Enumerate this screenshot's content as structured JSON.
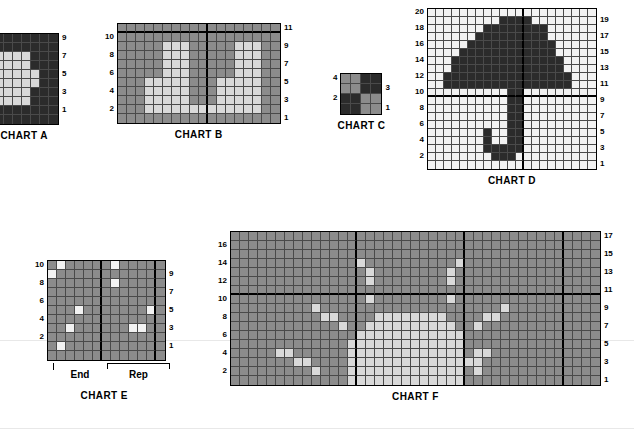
{
  "page": {
    "background": "#ffffff"
  },
  "palette": {
    "dark": "#2b2b2b",
    "mid": "#8c8c8c",
    "light": "#d9d9d9",
    "white": "#f2f2f2",
    "grid_line": "#4a4a4a",
    "heavy_line": "#000000"
  },
  "charts": [
    {
      "id": "chart-a",
      "caption": "CHART A",
      "cols": 8,
      "rows": 10,
      "cell": 9,
      "clipped_left": true,
      "axis_left": [],
      "axis_right": [
        "9",
        "",
        "7",
        "",
        "5",
        "",
        "3",
        "",
        "1",
        ""
      ],
      "cells": [
        "DDDDDDDD",
        "DDDDDDDD",
        "LLLLLDDD",
        "LLLLLDDD",
        "LLLLLLDD",
        "LLLLLLDD",
        "LLLLLDDD",
        "LLLLLDDD",
        "DDDDDDDD",
        "DDDDDDDD"
      ]
    },
    {
      "id": "chart-b",
      "caption": "CHART B",
      "cols": 18,
      "rows": 11,
      "cell": 9,
      "heavy_col_after": 10,
      "heavy_row_after": 0,
      "axis_left": [
        "",
        "10",
        "",
        "8",
        "",
        "6",
        "",
        "4",
        "",
        "2",
        ""
      ],
      "axis_right": [
        "11",
        "",
        "9",
        "",
        "7",
        "",
        "5",
        "",
        "3",
        "",
        "1"
      ],
      "cells": [
        "MMMMMMMMMMMMMMMMMM",
        "MMMMMMMMMMMMMMMMMM",
        "MMMMMLLLMMMMMLLLMM",
        "MMMMMLLLMMMMMLLLMM",
        "MMMMMLLLMMMMMLLLMM",
        "MMMMMLLLMMMMMLLLMM",
        "MMMLLLLLMMMLLLLLMM",
        "MMMLLLLLMMMLLLLLMM",
        "MMMLLLLLMMMLLLLLMM",
        "MMMLLLLLLLLLLLLLMM",
        "MMMMMMMMMMMMMMMMMM"
      ]
    },
    {
      "id": "chart-c",
      "caption": "CHART C",
      "cols": 4,
      "rows": 4,
      "cell": 10,
      "axis_left": [
        "4",
        "",
        "2",
        ""
      ],
      "axis_right": [
        "",
        "3",
        "",
        "1"
      ],
      "cells": [
        "MMDD",
        "MMDD",
        "DDMM",
        "DDMM"
      ]
    },
    {
      "id": "chart-d",
      "caption": "CHART D",
      "cols": 21,
      "rows": 20,
      "cell": 8,
      "heavy_col_after": 12,
      "heavy_row_after": 10,
      "axis_left": [
        "20",
        "",
        "18",
        "",
        "16",
        "",
        "14",
        "",
        "12",
        "",
        "10",
        "",
        "8",
        "",
        "6",
        "",
        "4",
        "",
        "2",
        ""
      ],
      "axis_right": [
        "",
        "19",
        "",
        "17",
        "",
        "15",
        "",
        "13",
        "",
        "11",
        "",
        "9",
        "",
        "7",
        "",
        "5",
        "",
        "3",
        "",
        "1"
      ],
      "cells": [
        "WWWWWWWWWWWWWWWWWWWWW",
        "WWWWWWWWWDDDDWWWWWWWW",
        "WWWWWWWDDDDDDDDWWWWWW",
        "WWWWWWDDDDDDDDDWWWWWW",
        "WWWWWDDDDDDDDDDDWWWWW",
        "WWWWDDDDDDDDDDDDWWWWW",
        "WWWDDDDDDDDDDDDDDWWWW",
        "WWWDDDDDDDDDDDDDDWWWW",
        "WWDDDDDDDDDDDDDDDDWWW",
        "WWDDDDDDDDDDDDDDDDWWW",
        "WWWWWWWWWWDDWWWWWWWWW",
        "WWWWWWWWWWDDWWWWWWWWW",
        "WWWWWWWWWWDDWWWWWWWWW",
        "WWWWWWWWWWDDWWWWWWWWW",
        "WWWWWWWWWWDDWWWWWWWWW",
        "WWWWWWWDWWDDWWWWWWWWW",
        "WWWWWWWDWWDDWWWWWWWWW",
        "WWWWWWWDDDDDWWWWWWWWW",
        "WWWWWWWWDDDWWWWWWWWWW",
        "WWWWWWWWWWWWWWWWWWWWW"
      ]
    },
    {
      "id": "chart-e",
      "caption": "CHART E",
      "cols": 13,
      "rows": 11,
      "cell": 9,
      "heavy_col_after": 6,
      "heavy_col2_after": 12,
      "axis_left": [
        "10",
        "",
        "8",
        "",
        "6",
        "",
        "4",
        "",
        "2",
        "",
        ""
      ],
      "axis_right": [
        "",
        "9",
        "",
        "7",
        "",
        "5",
        "",
        "3",
        "",
        "1",
        ""
      ],
      "cells": [
        "MWMMMMMWMMMMM",
        "WMMMMMMMMMMMM",
        "MMMMMMMWMMMMM",
        "MMMMMMMMMMMMM",
        "MMMMMMMMMMMMM",
        "MMMWMMMMMMMWM",
        "MMMMMMMMMMMMM",
        "MMWMMMMMMWWMM",
        "MMMMMMMMMMMMM",
        "MWMMMMMMMMMMM",
        "MMMMMMMMMMMMM"
      ],
      "brackets": [
        {
          "label": "End",
          "span": 6,
          "type": "tick"
        },
        {
          "label": "Rep",
          "span": 7,
          "type": "with-bar"
        }
      ]
    },
    {
      "id": "chart-f",
      "caption": "CHART F",
      "cols": 41,
      "rows": 17,
      "cell": 9,
      "heavy_col_after": 14,
      "heavy_col2_after": 26,
      "heavy_col3_after": 37,
      "heavy_row_after": 6,
      "axis_left": [
        "",
        "16",
        "",
        "14",
        "",
        "12",
        "",
        "10",
        "",
        "8",
        "",
        "6",
        "",
        "4",
        "",
        "2",
        ""
      ],
      "axis_right": [
        "17",
        "",
        "15",
        "",
        "13",
        "",
        "11",
        "",
        "9",
        "",
        "7",
        "",
        "5",
        "",
        "3",
        "",
        "1"
      ],
      "cells": [
        "MMMMMMMMMMMMMMMMMMMMMMMMMMMMMMMMMMMMMMMMM",
        "MMMMMMMMMMMMMMMMMMMMMMMMMMMMMMMMMMMMMMMMM",
        "MMMMMMMMMMMMMMMMMMMMMMMMMMMMMMMMMMMMMMMMM",
        "MMMMMMMMMMMMMMLMMMMMMMMMMLMMMMMMMMMMMMMMM",
        "MMMMMMMMMMMMMMMLMMMMMMMMLMMMMMMMMMMMMMMMM",
        "MMMMMMMMMMMMMMMLMMMMMMMMLMMMMMMMMMMMMMMMM",
        "MMMMMMMMMMMMMMMMMMMMMMMMMMMMMMMMMMMMMMMMM",
        "MMMMMMMMMMMMMMMLMMMMMMMMLMMMMMMMMMMMMMMMM",
        "MMMMMMMMMLMMMMMMMMMMMMMMMMMMMMLMMMMMMMMMM",
        "MMMMMMMMMMLLMMMMLLLLLLLLMMMMLLMMMMMMMMMMM",
        "MMMMMMMMMMMMLMMLLLLLLLLLLMMLMMMMMMMMMMMMM",
        "MMMMMMMMMMMMMMLLLLLLLLLLLLMMMMMMMMMMMMMMM",
        "MMMMMMMMMMMMMLLLLLLLLLLLLLMMMMMMMMMMMMMMM",
        "MMMMMLLMMMMMMLLLLLLLLLLLLLMLLMMMMMMMMMMMM",
        "MMMMMMMLLMMMMLLLLLLLLLLLLLLLMMMMMMMMMMMMM",
        "MMMMMMMMMLMMMLLLLLLLLLLLLLMLMMMMMMMMMMMMM",
        "MMMMMMMMMMMMMLLLLLLLLLLLLLMMMMMMMMMMMMMMM"
      ]
    }
  ]
}
